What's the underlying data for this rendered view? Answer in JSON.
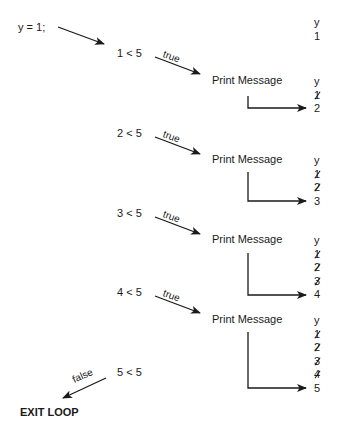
{
  "init": {
    "statement": "y = 1;"
  },
  "iterations": [
    {
      "condition": "1 < 5",
      "branch": "true",
      "action": "Print Message",
      "before": {
        "header": "y",
        "values": [
          "1"
        ]
      },
      "after": {
        "header": "y",
        "struck": [
          "1"
        ],
        "current": "2"
      }
    },
    {
      "condition": "2 < 5",
      "branch": "true",
      "action": "Print Message",
      "after": {
        "header": "y",
        "struck": [
          "1",
          "2"
        ],
        "current": "3"
      }
    },
    {
      "condition": "3 < 5",
      "branch": "true",
      "action": "Print Message",
      "after": {
        "header": "y",
        "struck": [
          "1",
          "2",
          "3"
        ],
        "current": "4"
      }
    },
    {
      "condition": "4 < 5",
      "branch": "true",
      "action": "Print Message",
      "after": {
        "header": "y",
        "struck": [
          "1",
          "2",
          "3",
          "4"
        ],
        "current": "5"
      }
    }
  ],
  "final": {
    "condition": "5 < 5",
    "branch": "false",
    "result": "EXIT LOOP"
  }
}
